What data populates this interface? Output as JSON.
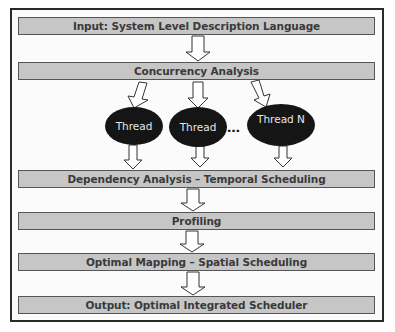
{
  "diagram": {
    "type": "flowchart",
    "steps": [
      {
        "id": "input",
        "label": "Input: System Level Description Language"
      },
      {
        "id": "concurrency",
        "label": "Concurrency Analysis"
      },
      {
        "id": "dependency",
        "label": "Dependency Analysis – Temporal Scheduling"
      },
      {
        "id": "profiling",
        "label": "Profiling"
      },
      {
        "id": "mapping",
        "label": "Optimal Mapping – Spatial Scheduling"
      },
      {
        "id": "output",
        "label": "Output: Optimal Integrated Scheduler"
      }
    ],
    "threads": [
      {
        "label": "Thread"
      },
      {
        "label": "Thread"
      },
      {
        "label": "Thread N"
      }
    ],
    "ellipsis": "…",
    "colors": {
      "box_fill": "#c6c6c6",
      "box_border": "#555555",
      "box_text": "#3a3a3a",
      "thread_fill": "#151515",
      "thread_text": "#e6e6e6",
      "frame_border": "#2a2a2a"
    }
  }
}
